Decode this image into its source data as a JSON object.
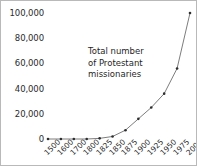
{
  "chart_data": {
    "type": "line",
    "title": "",
    "annotation": {
      "lines": [
        "Total number",
        "of Protestant",
        "missionaries"
      ],
      "full_text": "Total number of Protestant missionaries"
    },
    "xlabel": "",
    "ylabel": "",
    "categories": [
      "1500",
      "1600",
      "1700",
      "1800",
      "1825",
      "1850",
      "1875",
      "1900",
      "1925",
      "1950",
      "1975",
      "2000"
    ],
    "values": [
      0,
      0,
      0,
      0,
      500,
      2000,
      7000,
      16000,
      25000,
      36000,
      56000,
      100000
    ],
    "series": [
      {
        "name": "Total number of Protestant missionaries",
        "values": [
          0,
          0,
          0,
          0,
          500,
          2000,
          7000,
          16000,
          25000,
          36000,
          56000,
          100000
        ]
      }
    ],
    "ylim": [
      0,
      100000
    ],
    "y_ticks": [
      0,
      20000,
      40000,
      60000,
      80000,
      100000
    ],
    "y_tick_labels": [
      "0",
      "20,000",
      "40,000",
      "60,000",
      "80,000",
      "100,000"
    ],
    "x_tick_labels": [
      "1500",
      "1600",
      "1700",
      "1800",
      "1825",
      "1850",
      "1875",
      "1900",
      "1925",
      "1950",
      "1975",
      "2000"
    ],
    "grid": false,
    "legend": "none",
    "marker": "dot",
    "line_color": "#7d7d7d",
    "marker_color": "#2e2e2e",
    "text_color": "#2b2b2b",
    "background_color": "#ffffff",
    "border_color": "#b9b9b9"
  }
}
